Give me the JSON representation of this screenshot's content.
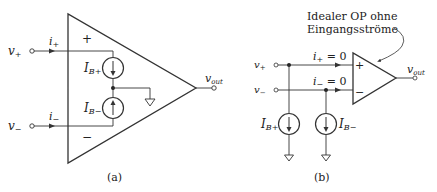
{
  "panel_a": {
    "caption": "(a)",
    "input_plus": {
      "v": "v",
      "v_sub": "+",
      "i": "i",
      "i_sub": "+"
    },
    "input_minus": {
      "v": "v",
      "v_sub": "−",
      "i": "i",
      "i_sub": "−"
    },
    "plus_sign": "+",
    "minus_sign": "−",
    "source_plus": {
      "I": "I",
      "sub": "B+"
    },
    "source_minus": {
      "I": "I",
      "sub": "B−"
    },
    "output": {
      "v": "v",
      "sub": "out"
    }
  },
  "panel_b": {
    "caption": "(b)",
    "annotation_line1": "Idealer OP ohne",
    "annotation_line2": "Eingangsströme",
    "input_plus": {
      "v": "v",
      "v_sub": "+",
      "i": "i",
      "i_sub": "+",
      "eq": " = 0"
    },
    "input_minus": {
      "v": "v",
      "v_sub": "−",
      "i": "i",
      "i_sub": "−",
      "eq": " = 0"
    },
    "plus_sign": "+",
    "minus_sign": "−",
    "source_plus": {
      "I": "I",
      "sub": "B+"
    },
    "source_minus": {
      "I": "I",
      "sub": "B−"
    },
    "output": {
      "v": "v",
      "sub": "out"
    }
  }
}
